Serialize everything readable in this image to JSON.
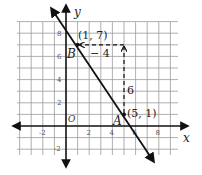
{
  "figure": {
    "axes": {
      "x_label": "x",
      "y_label": "y",
      "origin_label": "O",
      "x_ticks": [
        {
          "value": -2,
          "label": "-2"
        },
        {
          "value": 2,
          "label": "2"
        },
        {
          "value": 4,
          "label": "4"
        },
        {
          "value": 6,
          "label": "6"
        },
        {
          "value": 8,
          "label": "8"
        }
      ],
      "y_ticks": [
        {
          "value": 8,
          "label": "8"
        },
        {
          "value": 6,
          "label": "6"
        },
        {
          "value": 4,
          "label": "4"
        },
        {
          "value": 2,
          "label": "2"
        },
        {
          "value": -2,
          "label": "-2"
        }
      ],
      "grid_x_range": [
        -4,
        9
      ],
      "grid_y_range": [
        -2,
        9
      ]
    },
    "points": {
      "B": {
        "name": "B",
        "x": 1,
        "y": 7,
        "coord_label": "(1, 7)"
      },
      "A": {
        "name": "A",
        "x": 5,
        "y": 1,
        "coord_label": "(5, 1)"
      }
    },
    "rise": {
      "label": "6"
    },
    "run": {
      "label": "− 4"
    },
    "line": {
      "slope": -1.5,
      "description": "line through A(5, 1) and B(1, 7)"
    },
    "colors": {
      "line": "#111111",
      "grid": "#999999",
      "axis": "#111111",
      "background": "#ffffff"
    }
  }
}
